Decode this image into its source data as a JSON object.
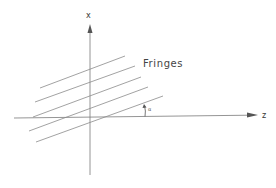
{
  "diagram": {
    "title": "",
    "labels": {
      "x_axis": "x",
      "z_axis": "z",
      "fringes": "Fringes",
      "angle": "α"
    },
    "colors": {
      "line": "#8a8a8a",
      "axis": "#7a7a7a",
      "text": "#3a3a3a",
      "background": "#ffffff"
    },
    "axes": {
      "origin": [
        90,
        118
      ],
      "x_axis": {
        "from": [
          90,
          175
        ],
        "to": [
          90,
          25
        ],
        "arrow": "up"
      },
      "z_axis": {
        "from": [
          14,
          118
        ],
        "to": [
          255,
          115
        ],
        "arrow": "right"
      }
    },
    "fringes": [
      {
        "from": [
          40,
          88
        ],
        "to": [
          125,
          56
        ]
      },
      {
        "from": [
          35,
          102
        ],
        "to": [
          135,
          66
        ]
      },
      {
        "from": [
          33,
          117
        ],
        "to": [
          141,
          77
        ]
      },
      {
        "from": [
          29,
          131
        ],
        "to": [
          148,
          87
        ]
      },
      {
        "from": [
          36,
          142
        ],
        "to": [
          163,
          96
        ]
      }
    ],
    "angle_marker": {
      "at_x": 145,
      "from_y": 117,
      "to_y": 105
    }
  }
}
